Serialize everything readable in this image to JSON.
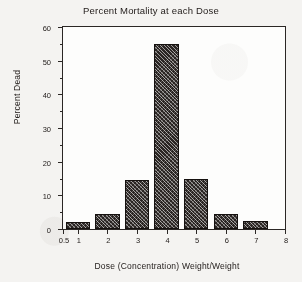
{
  "chart_data": {
    "type": "bar",
    "title": "Percent Mortality at each Dose",
    "xlabel": "Dose (Concentration) Weight/Weight",
    "ylabel": "Percent Dead",
    "categories": [
      "1",
      "2",
      "3",
      "4",
      "5",
      "6",
      "7"
    ],
    "values": [
      2,
      4.5,
      14.5,
      55,
      15,
      4.5,
      2.5
    ],
    "xlim": [
      0.5,
      8
    ],
    "ylim": [
      0,
      60
    ],
    "x_tick_labels": [
      "0.5",
      "1",
      "2",
      "3",
      "4",
      "5",
      "6",
      "7",
      "8"
    ],
    "x_tick_values": [
      0.5,
      1,
      2,
      3,
      4,
      5,
      6,
      7,
      8
    ],
    "y_tick_labels": [
      "0",
      "10",
      "20",
      "30",
      "40",
      "50",
      "60"
    ],
    "y_tick_values": [
      0,
      10,
      20,
      30,
      40,
      50,
      60
    ],
    "y_minor_tick_values": [
      5,
      15,
      25,
      35,
      45,
      55
    ],
    "grid": false,
    "legend": null,
    "bar_fill": "#2a2523",
    "bar_pattern": "diagonal-crosshatch",
    "axis_color": "#2b2725",
    "plot_background": "#fdfdfc",
    "page_background": "#f4f3f1"
  }
}
